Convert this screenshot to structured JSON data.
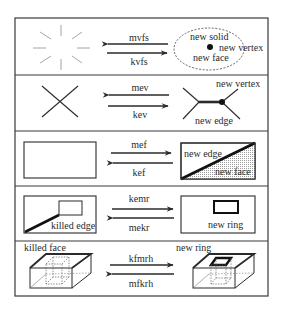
{
  "diagram": {
    "rows": [
      {
        "name": "row-mvfs",
        "forward_op": "mvfs",
        "inverse_op": "kvfs",
        "right_labels": [
          "new solid",
          "new vertex",
          "new face"
        ]
      },
      {
        "name": "row-mev",
        "forward_op": "mev",
        "inverse_op": "kev",
        "right_labels": [
          "new vertex",
          "new edge"
        ]
      },
      {
        "name": "row-mef",
        "forward_op": "mef",
        "inverse_op": "kef",
        "right_labels": [
          "new edge",
          "new face"
        ]
      },
      {
        "name": "row-kemr",
        "forward_op": "kemr",
        "inverse_op": "mekr",
        "left_labels": [
          "killed edge"
        ],
        "right_labels": [
          "new ring"
        ]
      },
      {
        "name": "row-kfmrh",
        "forward_op": "kfmrh",
        "inverse_op": "mfkrh",
        "left_labels": [
          "killed face"
        ],
        "right_labels": [
          "new ring"
        ]
      }
    ],
    "colors": {
      "line": "#2a2a2a",
      "frame": "#3a3a3a",
      "dash": "#8a8a8a",
      "hatch": "#bdbdbd",
      "background": "#ffffff"
    }
  }
}
